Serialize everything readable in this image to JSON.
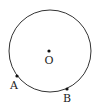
{
  "diagram": {
    "type": "circle-geometry",
    "circle": {
      "cx": 50,
      "cy": 51,
      "r": 41,
      "stroke": "#333333"
    },
    "points": [
      {
        "id": "O",
        "label": "O",
        "x": 49,
        "y": 51,
        "label_x": 49,
        "label_y": 64
      },
      {
        "id": "A",
        "label": "A",
        "x": 17,
        "y": 76,
        "label_x": 14,
        "label_y": 89
      },
      {
        "id": "B",
        "label": "B",
        "x": 67,
        "y": 89,
        "label_x": 67,
        "label_y": 102
      }
    ]
  }
}
